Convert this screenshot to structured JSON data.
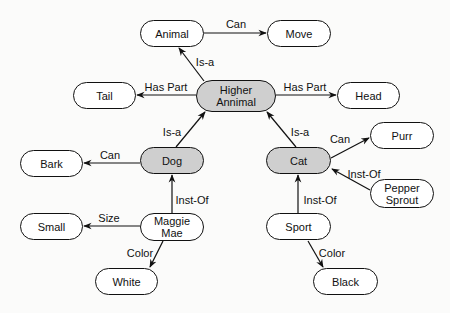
{
  "diagram": {
    "type": "semantic-network",
    "colors": {
      "node_fill": "#ffffff",
      "class_node_fill": "#cfcfcf",
      "stroke": "#111111",
      "background": "#fbfbfa"
    },
    "nodes": [
      {
        "id": "animal",
        "label": "Animal",
        "x": 140,
        "y": 20,
        "w": 64,
        "h": 27,
        "shaded": false
      },
      {
        "id": "move",
        "label": "Move",
        "x": 267,
        "y": 20,
        "w": 64,
        "h": 27,
        "shaded": false
      },
      {
        "id": "higher_animal",
        "label": "Higher\nAnnimal",
        "x": 196,
        "y": 80,
        "w": 80,
        "h": 32,
        "shaded": true
      },
      {
        "id": "tail",
        "label": "Tail",
        "x": 73,
        "y": 82,
        "w": 63,
        "h": 27,
        "shaded": false
      },
      {
        "id": "head",
        "label": "Head",
        "x": 337,
        "y": 82,
        "w": 63,
        "h": 27,
        "shaded": false
      },
      {
        "id": "dog",
        "label": "Dog",
        "x": 140,
        "y": 147,
        "w": 64,
        "h": 27,
        "shaded": true
      },
      {
        "id": "cat",
        "label": "Cat",
        "x": 266,
        "y": 147,
        "w": 65,
        "h": 27,
        "shaded": true
      },
      {
        "id": "bark",
        "label": "Bark",
        "x": 20,
        "y": 150,
        "w": 63,
        "h": 27,
        "shaded": false
      },
      {
        "id": "purr",
        "label": "Purr",
        "x": 370,
        "y": 122,
        "w": 64,
        "h": 27,
        "shaded": false
      },
      {
        "id": "pepper_sprout",
        "label": "Pepper\nSprout",
        "x": 370,
        "y": 179,
        "w": 64,
        "h": 29,
        "shaded": false
      },
      {
        "id": "maggie_mae",
        "label": "Maggie\nMae",
        "x": 140,
        "y": 213,
        "w": 64,
        "h": 28,
        "shaded": false
      },
      {
        "id": "small",
        "label": "Small",
        "x": 20,
        "y": 213,
        "w": 63,
        "h": 27,
        "shaded": false
      },
      {
        "id": "white",
        "label": "White",
        "x": 95,
        "y": 268,
        "w": 63,
        "h": 27,
        "shaded": false
      },
      {
        "id": "sport",
        "label": "Sport",
        "x": 266,
        "y": 213,
        "w": 65,
        "h": 27,
        "shaded": false
      },
      {
        "id": "black",
        "label": "Black",
        "x": 313,
        "y": 268,
        "w": 65,
        "h": 27,
        "shaded": false
      }
    ],
    "edges": [
      {
        "from": "animal",
        "to": "move",
        "label": "Can",
        "x1": 204,
        "y1": 33,
        "x2": 266,
        "y2": 33,
        "lx": 236,
        "ly": 24
      },
      {
        "from": "higher_animal",
        "to": "animal",
        "label": "Is-a",
        "x1": 204,
        "y1": 81,
        "x2": 179,
        "y2": 48,
        "lx": 205,
        "ly": 62
      },
      {
        "from": "higher_animal",
        "to": "tail",
        "label": "Has Part",
        "x1": 196,
        "y1": 95,
        "x2": 137,
        "y2": 95,
        "lx": 166,
        "ly": 87
      },
      {
        "from": "higher_animal",
        "to": "head",
        "label": "Has Part",
        "x1": 276,
        "y1": 95,
        "x2": 336,
        "y2": 95,
        "lx": 305,
        "ly": 87
      },
      {
        "from": "dog",
        "to": "higher_animal",
        "label": "Is-a",
        "x1": 176,
        "y1": 147,
        "x2": 205,
        "y2": 112,
        "lx": 172,
        "ly": 132
      },
      {
        "from": "cat",
        "to": "higher_animal",
        "label": "Is-a",
        "x1": 296,
        "y1": 147,
        "x2": 267,
        "y2": 112,
        "lx": 300,
        "ly": 132
      },
      {
        "from": "dog",
        "to": "bark",
        "label": "Can",
        "x1": 140,
        "y1": 163,
        "x2": 84,
        "y2": 163,
        "lx": 110,
        "ly": 155
      },
      {
        "from": "cat",
        "to": "purr",
        "label": "Can",
        "x1": 331,
        "y1": 158,
        "x2": 369,
        "y2": 138,
        "lx": 340,
        "ly": 139
      },
      {
        "from": "pepper_sprout",
        "to": "cat",
        "label": "Inst-Of",
        "x1": 370,
        "y1": 190,
        "x2": 332,
        "y2": 169,
        "lx": 364,
        "ly": 174
      },
      {
        "from": "maggie_mae",
        "to": "dog",
        "label": "Inst-Of",
        "x1": 172,
        "y1": 213,
        "x2": 172,
        "y2": 175,
        "lx": 192,
        "ly": 200
      },
      {
        "from": "maggie_mae",
        "to": "small",
        "label": "Size",
        "x1": 140,
        "y1": 226,
        "x2": 84,
        "y2": 226,
        "lx": 109,
        "ly": 218
      },
      {
        "from": "maggie_mae",
        "to": "white",
        "label": "Color",
        "x1": 163,
        "y1": 241,
        "x2": 150,
        "y2": 267,
        "lx": 140,
        "ly": 253
      },
      {
        "from": "sport",
        "to": "cat",
        "label": "Inst-Of",
        "x1": 298,
        "y1": 213,
        "x2": 298,
        "y2": 175,
        "lx": 320,
        "ly": 200
      },
      {
        "from": "sport",
        "to": "black",
        "label": "Color",
        "x1": 308,
        "y1": 241,
        "x2": 323,
        "y2": 267,
        "lx": 332,
        "ly": 253
      }
    ]
  }
}
